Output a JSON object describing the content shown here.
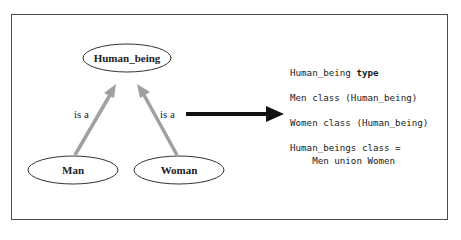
{
  "diagram": {
    "nodes": [
      {
        "id": "human_being",
        "label": "Human_being"
      },
      {
        "id": "man",
        "label": "Man"
      },
      {
        "id": "woman",
        "label": "Woman"
      }
    ],
    "edges": [
      {
        "from": "man",
        "to": "human_being",
        "label": "is a"
      },
      {
        "from": "woman",
        "to": "human_being",
        "label": "is a"
      }
    ],
    "colors": {
      "edge": "#a0a0a0",
      "border": "#4a4a4a",
      "arrow": "#111111"
    }
  },
  "code": {
    "line1_name": "Human_being ",
    "line1_kw": "type",
    "line2": "Men class (Human_being)",
    "line3": "Women class (Human_being)",
    "line4": "Human_beings class =",
    "line5": "    Men union Women"
  }
}
